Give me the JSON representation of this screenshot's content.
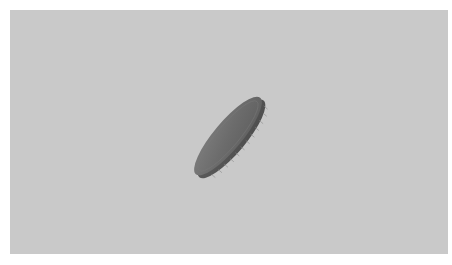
{
  "scene": {
    "subject": "coin",
    "description": "A single metallic coin tumbling mid-air, seen nearly edge-on and tilted diagonally",
    "colors": {
      "border": "#ffffff",
      "background": "#c9c9c9",
      "coin_face": "#6e6e6e",
      "coin_face_highlight": "#7c7c7c",
      "coin_rim": "#5a5a5a",
      "coin_rim_ridges": "#8a8a8a",
      "coin_shadow_edge": "#4a4a4a"
    }
  }
}
